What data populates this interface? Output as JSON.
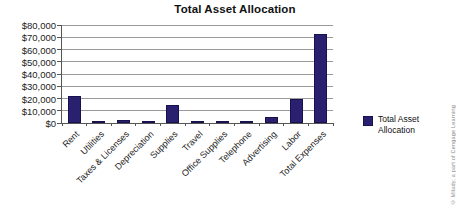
{
  "title": "Total Asset Allocation",
  "legend": {
    "label": "Total Asset Allocation",
    "swatch_color": "#2a2070"
  },
  "copyright": "© Milady, a part of Cengage Learning",
  "chart_data": {
    "type": "bar",
    "title": "Total Asset Allocation",
    "categories": [
      "Rent",
      "Utilities",
      "Taxes & Licenses",
      "Depreciation",
      "Supplies",
      "Travel",
      "Office Supplies",
      "Telephone",
      "Advertising",
      "Labor",
      "Total Expenses"
    ],
    "values": [
      22000,
      2000,
      2500,
      1500,
      15000,
      1500,
      2000,
      1500,
      5000,
      20000,
      73000
    ],
    "series_name": "Total Asset Allocation",
    "xlabel": "",
    "ylabel": "",
    "ylim": [
      0,
      80000
    ],
    "ytick_step": 10000,
    "ytick_labels": [
      "$0",
      "$10,000",
      "$20,000",
      "$30,000",
      "$40,000",
      "$50,000",
      "$60,000",
      "$70,000",
      "$80,000"
    ],
    "grid": "horizontal",
    "legend_position": "right",
    "bar_color": "#2a2070",
    "gridline_color": "#9a9a9a",
    "axis_color": "#555555"
  }
}
